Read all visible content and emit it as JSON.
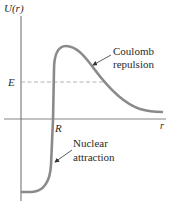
{
  "diagram": {
    "type": "potential-energy-curve",
    "y_axis_label": "U(r)",
    "x_axis_label": "r",
    "energy_label": "E",
    "radius_label": "R",
    "annotations": [
      {
        "id": "coulomb",
        "lines": [
          "Coulomb",
          "repulsion"
        ]
      },
      {
        "id": "nuclear",
        "lines": [
          "Nuclear",
          "attraction"
        ]
      }
    ],
    "colors": {
      "curve": "#808080",
      "axis": "#555555",
      "dashed_line": "#9a9a9a",
      "text": "#2a2a2a"
    }
  }
}
